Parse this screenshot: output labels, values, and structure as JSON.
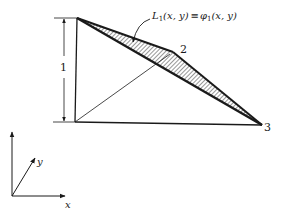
{
  "figure": {
    "function_label": {
      "L": "L",
      "L_sub": "1",
      "L_args": "(x, y)",
      "equiv": "≡",
      "phi": "φ",
      "phi_sub": "1",
      "phi_args": "(x, y)"
    },
    "node_labels": {
      "node2": "2",
      "node3": "3"
    },
    "dimension_label": "1",
    "axes": {
      "x_label": "x",
      "y_label": "y"
    },
    "colors": {
      "line": "#1a1a1a",
      "background": "#ffffff"
    }
  }
}
